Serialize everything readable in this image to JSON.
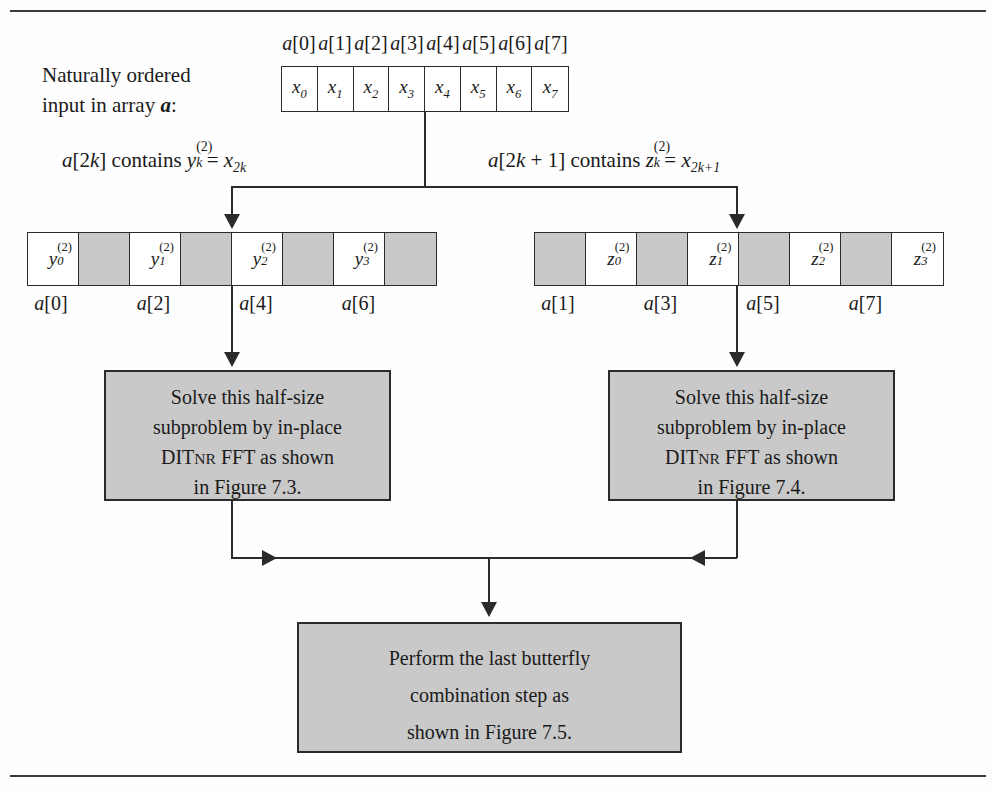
{
  "figure": {
    "caption_lines": [
      "Naturally ordered",
      "input in array a:"
    ],
    "caption_array_symbol": "a"
  },
  "top_array": {
    "index_labels": [
      "a[0]",
      "a[1]",
      "a[2]",
      "a[3]",
      "a[4]",
      "a[5]",
      "a[6]",
      "a[7]"
    ],
    "cells": [
      {
        "base": "x",
        "sub": "0",
        "shaded": false
      },
      {
        "base": "x",
        "sub": "1",
        "shaded": false
      },
      {
        "base": "x",
        "sub": "2",
        "shaded": false
      },
      {
        "base": "x",
        "sub": "3",
        "shaded": false
      },
      {
        "base": "x",
        "sub": "4",
        "shaded": false
      },
      {
        "base": "x",
        "sub": "5",
        "shaded": false
      },
      {
        "base": "x",
        "sub": "6",
        "shaded": false
      },
      {
        "base": "x",
        "sub": "7",
        "shaded": false
      }
    ]
  },
  "equations": {
    "left": "a[2k] contains",
    "left_var": {
      "base": "y",
      "sub": "k",
      "sup": "(2)"
    },
    "left_rhs": "= x",
    "left_rhs_sub": "2k",
    "right": "a[2k + 1] contains",
    "right_var": {
      "base": "z",
      "sub": "k",
      "sup": "(2)"
    },
    "right_rhs": "= x",
    "right_rhs_sub": "2k+1"
  },
  "left_array": {
    "cells": [
      {
        "base": "y",
        "sub": "0",
        "sup": "(2)",
        "shaded": false
      },
      {
        "base": "",
        "sub": "",
        "sup": "",
        "shaded": true
      },
      {
        "base": "y",
        "sub": "1",
        "sup": "(2)",
        "shaded": false
      },
      {
        "base": "",
        "sub": "",
        "sup": "",
        "shaded": true
      },
      {
        "base": "y",
        "sub": "2",
        "sup": "(2)",
        "shaded": false
      },
      {
        "base": "",
        "sub": "",
        "sup": "",
        "shaded": true
      },
      {
        "base": "y",
        "sub": "3",
        "sup": "(2)",
        "shaded": false
      },
      {
        "base": "",
        "sub": "",
        "sup": "",
        "shaded": true
      }
    ],
    "index_labels": [
      "a[0]",
      "a[2]",
      "a[4]",
      "a[6]"
    ]
  },
  "right_array": {
    "cells": [
      {
        "base": "",
        "sub": "",
        "sup": "",
        "shaded": true
      },
      {
        "base": "z",
        "sub": "0",
        "sup": "(2)",
        "shaded": false
      },
      {
        "base": "",
        "sub": "",
        "sup": "",
        "shaded": true
      },
      {
        "base": "z",
        "sub": "1",
        "sup": "(2)",
        "shaded": false
      },
      {
        "base": "",
        "sub": "",
        "sup": "",
        "shaded": true
      },
      {
        "base": "z",
        "sub": "2",
        "sup": "(2)",
        "shaded": false
      },
      {
        "base": "",
        "sub": "",
        "sup": "",
        "shaded": true
      },
      {
        "base": "z",
        "sub": "3",
        "sup": "(2)",
        "shaded": false
      }
    ],
    "index_labels": [
      "a[1]",
      "a[3]",
      "a[5]",
      "a[7]"
    ]
  },
  "box_left": {
    "line1": "Solve this half-size",
    "line2": "subproblem by in-place",
    "line3_pre": "DIT",
    "line3_sc": "NR",
    "line3_post": " FFT as shown",
    "line4": "in Figure 7.3."
  },
  "box_right": {
    "line1": "Solve this half-size",
    "line2": "subproblem by in-place",
    "line3_pre": "DIT",
    "line3_sc": "NR",
    "line3_post": " FFT as shown",
    "line4": "in Figure 7.4."
  },
  "box_bottom": {
    "line1": "Perform the last butterfly",
    "line2": "combination step as",
    "line3": "shown in Figure 7.5."
  },
  "colors": {
    "shaded_cell": "#c9c9c9",
    "box_fill": "#c9c9c9",
    "stroke": "#2b2b2b"
  }
}
